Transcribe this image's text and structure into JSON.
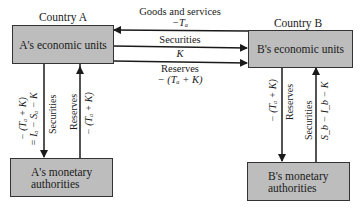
{
  "country_a": {
    "title": "Country A",
    "economic_units": "A's economic units",
    "monetary_authorities_line1": "A's monetary",
    "monetary_authorities_line2": "authorities"
  },
  "country_b": {
    "title": "Country B",
    "economic_units": "B's economic units",
    "monetary_authorities_line1": "B's monetary",
    "monetary_authorities_line2": "authorities"
  },
  "flows_between": {
    "goods_label": "Goods and services",
    "goods_value": "−Tₐ",
    "securities_label": "Securities",
    "securities_value": "K",
    "reserves_label": "Reserves",
    "reserves_value": "− (Tₐ + K)"
  },
  "flows_a": {
    "securities_expr1": "− (Tₐ + K)",
    "securities_expr2": "= Iₐ − Sₐ − K",
    "securities_label": "Securities",
    "reserves_label": "Reserves",
    "reserves_value": "− (Tₐ + K)"
  },
  "flows_b": {
    "reserves_value": "− (Tₐ + K)",
    "reserves_label": "Reserves",
    "securities_label": "Securities",
    "securities_expr": "S_b − I_b − K"
  },
  "colors": {
    "box_fill": "#bdbdbd",
    "line": "#1a1a1a"
  }
}
